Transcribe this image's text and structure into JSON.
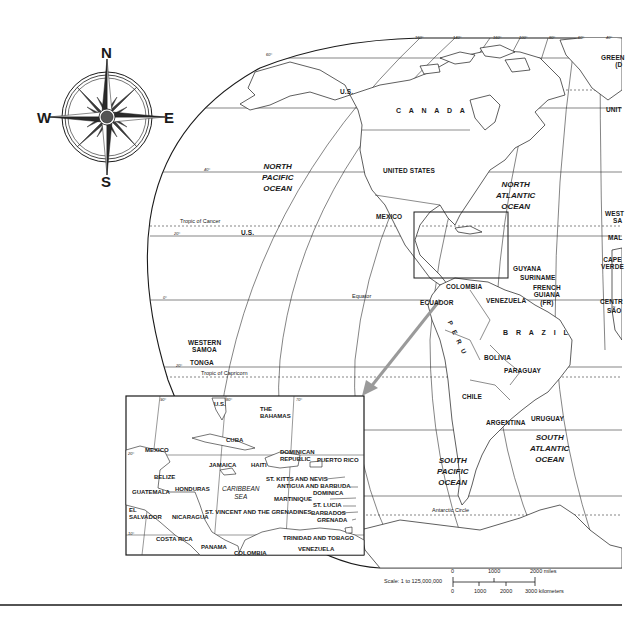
{
  "compass": {
    "north": "N",
    "south": "S",
    "east": "E",
    "west": "W"
  },
  "main_map": {
    "longitude_labels": [
      "160°",
      "140°",
      "120°",
      "100°",
      "80°",
      "60°",
      "40°"
    ],
    "latitude_labels": [
      "60°",
      "40°",
      "20°",
      "0°",
      "20°"
    ],
    "reference_lines": {
      "tropic_of_cancer": "Tropic of Cancer",
      "equator": "Equator",
      "tropic_of_capricorn": "Tropic of Capricorn",
      "antarctic_circle": "Antarctic Circle"
    },
    "oceans": {
      "north_pacific": [
        "NORTH",
        "PACIFIC",
        "OCEAN"
      ],
      "north_atlantic": [
        "NORTH",
        "ATLANTIC",
        "OCEAN"
      ],
      "south_pacific": [
        "SOUTH",
        "PACIFIC",
        "OCEAN"
      ],
      "south_atlantic": [
        "SOUTH",
        "ATLANTIC",
        "OCEAN"
      ]
    },
    "countries": {
      "us_alaska": "U.S.",
      "canada": "C A N A D A",
      "united_states": "UNITED  STATES",
      "mexico": "MEXICO",
      "us_hawaii": "U.S.",
      "colombia": "COLOMBIA",
      "venezuela": "VENEZUELA",
      "guyana": "GUYANA",
      "suriname": "SURINAME",
      "french_guiana": [
        "FRENCH",
        "GUIANA",
        "(FR)"
      ],
      "ecuador": "ECUADOR",
      "peru": "P E R U",
      "brazil": "B R A Z I L",
      "bolivia": "BOLIVIA",
      "paraguay": "PARAGUAY",
      "chile": "CHILE",
      "argentina": "ARGENTINA",
      "uruguay": "URUGUAY",
      "western_samoa": [
        "WESTERN",
        "SAMOA"
      ],
      "tonga": "TONGA",
      "greenland_partial": [
        "GREEN",
        "(D"
      ],
      "united_kingdom_partial": "UNIT",
      "western_sahara_partial": [
        "WEST",
        "SA"
      ],
      "mali_partial": "MAL",
      "cape_verde": [
        "CAPE",
        "VERDE"
      ],
      "central_african_partial": "CENTR",
      "sao_tome_partial": "SÃO"
    }
  },
  "inset_map": {
    "longitude_labels": [
      "90°",
      "80°",
      "70°"
    ],
    "latitude_labels": [
      "20°",
      "10°"
    ],
    "sea": [
      "CARIBBEAN",
      "SEA"
    ],
    "labels": {
      "us": "U.S.",
      "bahamas": [
        "THE",
        "BAHAMAS"
      ],
      "cuba": "CUBA",
      "mexico": "MEXICO",
      "jamaica": "JAMAICA",
      "haiti": "HAITI",
      "dominican_republic": [
        "DOMINICAN",
        "REPUBLIC"
      ],
      "puerto_rico": "PUERTO RICO",
      "belize": "BELIZE",
      "guatemala": "GUATEMALA",
      "honduras": "HONDURAS",
      "el_salvador": [
        "EL",
        "SALVADOR"
      ],
      "nicaragua": "NICARAGUA",
      "costa_rica": "COSTA RICA",
      "panama": "PANAMA",
      "colombia": "COLOMBIA",
      "venezuela": "VENEZUELA",
      "st_kitts": "ST. KITTS AND NEVIS",
      "antigua": "ANTIGUA AND BARBUDA",
      "dominica": "DOMINICA",
      "martinique": "MARTINIQUE",
      "st_lucia": "ST. LUCIA",
      "st_vincent": "ST. VINCENT AND THE GRENADINES",
      "barbados": "BARBADOS",
      "grenada": "GRENADA",
      "trinidad": "TRINIDAD AND TOBAGO"
    }
  },
  "scale": {
    "label": "Scale:  1 to 125,000,000",
    "miles_ticks": [
      "0",
      "1000",
      "2000 miles"
    ],
    "km_ticks": [
      "0",
      "1000",
      "2000",
      "3000 kilometers"
    ]
  },
  "colors": {
    "ink": "#1a1a1a",
    "grid": "#333333",
    "inset_arrow": "#9a9a9a",
    "background": "#ffffff"
  }
}
